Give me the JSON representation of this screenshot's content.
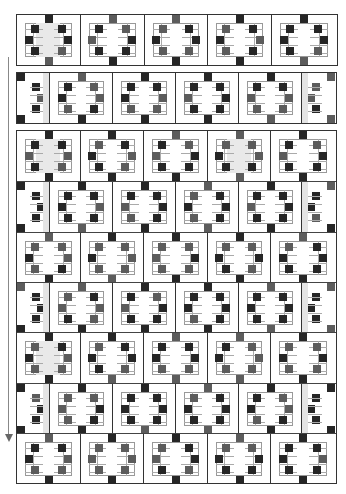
{
  "diagram": {
    "type": "quilt-layout",
    "arrow": {
      "direction": "down",
      "label": ""
    },
    "colors": {
      "dark": "#262626",
      "medium": "#5c5c5c",
      "light": "#e9e9e9",
      "line": "#333333"
    },
    "strips": [
      {
        "id": "row-1",
        "group": "separate-strip",
        "blocks": [
          "full",
          "full",
          "full",
          "full",
          "full"
        ],
        "shaded": [
          0
        ]
      },
      {
        "id": "row-2",
        "group": "separate-strip",
        "blocks": [
          "half",
          "full",
          "full",
          "full",
          "full",
          "half"
        ],
        "shaded": []
      }
    ],
    "panel": {
      "rows": [
        {
          "id": "row-3",
          "blocks": [
            "full",
            "full",
            "full",
            "full",
            "full"
          ],
          "shaded": [
            0,
            3
          ]
        },
        {
          "id": "row-4",
          "blocks": [
            "half",
            "full",
            "full",
            "full",
            "full",
            "half"
          ],
          "shaded": []
        },
        {
          "id": "row-5",
          "blocks": [
            "full",
            "full",
            "full",
            "full",
            "full"
          ],
          "shaded": []
        },
        {
          "id": "row-6",
          "blocks": [
            "half",
            "full",
            "full",
            "full",
            "full",
            "half"
          ],
          "shaded": []
        },
        {
          "id": "row-7",
          "blocks": [
            "full",
            "full",
            "full",
            "full",
            "full"
          ],
          "shaded": [
            0
          ]
        },
        {
          "id": "row-8",
          "blocks": [
            "half",
            "full",
            "full",
            "full",
            "full",
            "half"
          ],
          "shaded": []
        },
        {
          "id": "row-9",
          "blocks": [
            "full",
            "full",
            "full",
            "full",
            "full"
          ],
          "shaded": []
        }
      ]
    }
  }
}
